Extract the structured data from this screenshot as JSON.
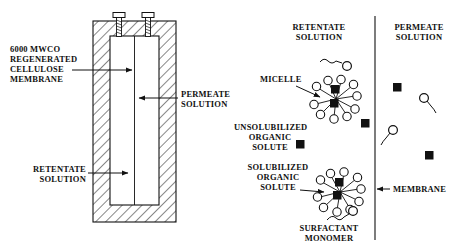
{
  "figure": {
    "background": "#ffffff",
    "ink": "#111111"
  },
  "cell_diagram": {
    "labels": {
      "membrane_spec": "6000 MWCO\nREGENERATED\nCELLULOSE\nMEMBRANE",
      "permeate": "PERMEATE\nSOLUTION",
      "retentate": "RETENTATE\nSOLUTION"
    },
    "parts": {
      "screw_left": "screw-left",
      "screw_right": "screw-right",
      "body": "hatched-cell-body",
      "chamber": "inner-chamber",
      "membrane_line": "vertical-membrane"
    }
  },
  "mechanism_diagram": {
    "labels": {
      "retentate": "RETENTATE\nSOLUTION",
      "permeate": "PERMEATE\nSOLUTION",
      "micelle": "MICELLE",
      "unsolubilized": "UNSOLUBILIZED\nORGANIC\nSOLUTE",
      "solubilized": "SOLUBILIZED\nORGANIC\nSOLUTE",
      "surfactant_monomer": "SURFACTANT\nMONOMER",
      "membrane": "MEMBRANE"
    },
    "species": {
      "micelle_count": 2,
      "retentate_squares": 2,
      "retentate_monomers": 1,
      "permeate_squares": 2,
      "permeate_monomers": 2
    }
  }
}
